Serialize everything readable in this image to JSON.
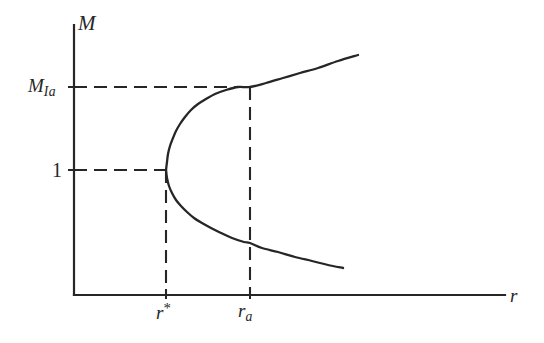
{
  "figure": {
    "title": "",
    "background_color": "#ffffff",
    "line_color": "#262626",
    "width": 544,
    "height": 343
  },
  "axes": {
    "y_axis": {
      "label": "M",
      "name": "M"
    },
    "x_axis": {
      "label": "r",
      "name": "r"
    }
  },
  "y_ticks": [
    {
      "key": "M_Ia",
      "base": "M",
      "sub": "Ia",
      "sup": "",
      "value_y": 87
    },
    {
      "key": "one",
      "base": "1",
      "sub": "",
      "sup": "",
      "value_y": 170
    }
  ],
  "x_ticks": [
    {
      "key": "r_star",
      "base": "r",
      "sub": "",
      "sup": "*",
      "value_x": 166
    },
    {
      "key": "r_a",
      "base": "r",
      "sub": "a",
      "sup": "",
      "value_x": 250
    }
  ],
  "chart_data": {
    "type": "line",
    "title": "",
    "xlabel": "r",
    "ylabel": "M",
    "grid": false,
    "legend": null,
    "axis_origin_px": {
      "x": 74,
      "y": 295
    },
    "x_axis_end_px": 505,
    "y_axis_top_px": 25,
    "annotations": [
      {
        "name": "fold-point",
        "label": "r*",
        "x_px": 166,
        "y_px": 170
      },
      {
        "name": "upper-branch-marker",
        "label": "r_a",
        "x_px": 250,
        "y_px": 87
      }
    ],
    "series": [
      {
        "name": "upper-branch",
        "description": "Upper solution branch of the fold, rising from the turning point",
        "points_px": [
          [
            166,
            170
          ],
          [
            167,
            162
          ],
          [
            168,
            154
          ],
          [
            170,
            146
          ],
          [
            173,
            138
          ],
          [
            176,
            131
          ],
          [
            180,
            124
          ],
          [
            185,
            117
          ],
          [
            191,
            110
          ],
          [
            198,
            104
          ],
          [
            206,
            99
          ],
          [
            215,
            94
          ],
          [
            226,
            90
          ],
          [
            238,
            87
          ],
          [
            250,
            87
          ],
          [
            266,
            83
          ],
          [
            283,
            78
          ],
          [
            300,
            73
          ],
          [
            318,
            68
          ],
          [
            338,
            61
          ],
          [
            358,
            55
          ]
        ]
      },
      {
        "name": "lower-branch",
        "description": "Lower solution branch of the fold, falling from the turning point",
        "points_px": [
          [
            166,
            170
          ],
          [
            167,
            178
          ],
          [
            169,
            186
          ],
          [
            172,
            193
          ],
          [
            176,
            200
          ],
          [
            181,
            206
          ],
          [
            187,
            212
          ],
          [
            194,
            218
          ],
          [
            202,
            223
          ],
          [
            211,
            228
          ],
          [
            221,
            233
          ],
          [
            232,
            238
          ],
          [
            244,
            242
          ],
          [
            250,
            243
          ],
          [
            262,
            248
          ],
          [
            278,
            252
          ],
          [
            295,
            257
          ],
          [
            312,
            261
          ],
          [
            328,
            265
          ],
          [
            343,
            268
          ]
        ]
      }
    ],
    "dashed_guides": [
      {
        "name": "M_Ia-horizontal",
        "x1": 74,
        "y1": 87,
        "x2": 250,
        "y2": 87
      },
      {
        "name": "one-horizontal",
        "x1": 74,
        "y1": 170,
        "x2": 166,
        "y2": 170
      },
      {
        "name": "r-star-vertical",
        "x1": 166,
        "y1": 170,
        "x2": 166,
        "y2": 295
      },
      {
        "name": "r-a-vertical",
        "x1": 250,
        "y1": 87,
        "x2": 250,
        "y2": 295
      }
    ],
    "tick_marks": [
      {
        "name": "y-tick-M_Ia",
        "x1": 68,
        "y1": 87,
        "x2": 80,
        "y2": 87
      },
      {
        "name": "y-tick-one",
        "x1": 68,
        "y1": 170,
        "x2": 80,
        "y2": 170
      },
      {
        "name": "x-tick-r-star",
        "x1": 166,
        "y1": 289,
        "x2": 166,
        "y2": 299
      },
      {
        "name": "x-tick-r-a",
        "x1": 250,
        "y1": 289,
        "x2": 250,
        "y2": 299
      }
    ]
  }
}
